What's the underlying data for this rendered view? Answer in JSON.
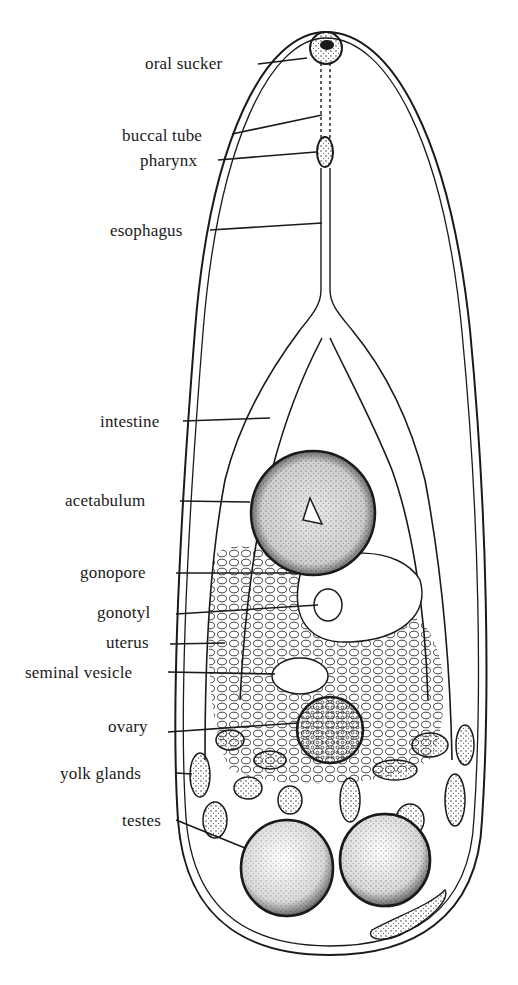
{
  "diagram": {
    "ink_color": "#1a1a1a",
    "background": "#ffffff",
    "labels": [
      {
        "id": "oral-sucker",
        "text": "oral sucker",
        "x": 145,
        "y": 55,
        "line_to": [
          305,
          58
        ]
      },
      {
        "id": "buccal-tube",
        "text": "buccal tube",
        "x": 122,
        "y": 127,
        "line_to": [
          322,
          115
        ]
      },
      {
        "id": "pharynx",
        "text": "pharynx",
        "x": 140,
        "y": 152,
        "line_to": [
          316,
          152
        ]
      },
      {
        "id": "esophagus",
        "text": "esophagus",
        "x": 110,
        "y": 222,
        "line_to": [
          322,
          223
        ]
      },
      {
        "id": "intestine",
        "text": "intestine",
        "x": 100,
        "y": 413,
        "line_to": [
          270,
          418
        ]
      },
      {
        "id": "acetabulum",
        "text": "acetabulum",
        "x": 65,
        "y": 492,
        "line_to": [
          248,
          500
        ]
      },
      {
        "id": "gonopore",
        "text": "gonopore",
        "x": 80,
        "y": 564,
        "line_to": [
          300,
          573
        ]
      },
      {
        "id": "gonotyl",
        "text": "gonotyl",
        "x": 97,
        "y": 604,
        "line_to": [
          318,
          605
        ]
      },
      {
        "id": "uterus",
        "text": "uterus",
        "x": 106,
        "y": 634,
        "line_to": [
          225,
          643
        ]
      },
      {
        "id": "seminal-vesicle",
        "text": "seminal vesicle",
        "x": 25,
        "y": 664,
        "line_to": [
          275,
          674
        ]
      },
      {
        "id": "ovary",
        "text": "ovary",
        "x": 108,
        "y": 718,
        "line_to": [
          300,
          722
        ]
      },
      {
        "id": "yolk-glands",
        "text": "yolk glands",
        "x": 60,
        "y": 765,
        "line_to": [
          190,
          774
        ]
      },
      {
        "id": "testes",
        "text": "testes",
        "x": 122,
        "y": 816,
        "line_to": [
          245,
          848
        ]
      }
    ]
  }
}
